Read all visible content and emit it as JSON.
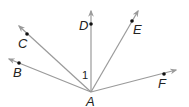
{
  "diagram": {
    "type": "rays-from-point",
    "vertex": {
      "label": "A",
      "x": 91,
      "y": 92
    },
    "rays": [
      {
        "label": "B",
        "point": [
          19,
          63
        ],
        "end": [
          9,
          59
        ]
      },
      {
        "label": "C",
        "point": [
          27,
          34
        ],
        "end": [
          19,
          26
        ]
      },
      {
        "label": "D",
        "point": [
          91,
          24
        ],
        "end": [
          91,
          11
        ]
      },
      {
        "label": "E",
        "point": [
          132,
          21
        ],
        "end": [
          138,
          11
        ]
      },
      {
        "label": "F",
        "point": [
          164,
          74
        ],
        "end": [
          176,
          70
        ]
      }
    ],
    "angle_label": "1",
    "colors": {
      "ray": "#9a9a9a",
      "point": "#111111",
      "text": "#222222"
    }
  }
}
